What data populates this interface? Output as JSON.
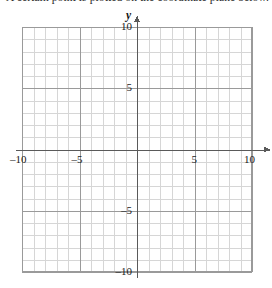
{
  "page": {
    "clipped_heading_text": "A certain point is plotted on the coordinate plane below.",
    "background_color": "#ffffff"
  },
  "figure": {
    "name": "coordinate-plane",
    "colors": {
      "minor_grid": "#d6d6d6",
      "major_grid": "#9a9a9a",
      "axis": "#5a5a5a",
      "label_text": "#1a1a1a"
    },
    "x_axis": {
      "letter": "y",
      "letter_x": "x",
      "min": -10,
      "max": 10,
      "tick_labels": [
        {
          "value": -10,
          "text": "–10"
        },
        {
          "value": -5,
          "text": "–5"
        },
        {
          "value": 5,
          "text": "5"
        },
        {
          "value": 10,
          "text": "10"
        }
      ]
    },
    "y_axis": {
      "min": -10,
      "max": 10,
      "tick_labels": [
        {
          "value": 10,
          "text": "10"
        },
        {
          "value": 5,
          "text": "5"
        },
        {
          "value": -5,
          "text": "–5"
        },
        {
          "value": -10,
          "text": "–10"
        }
      ]
    },
    "grid": {
      "minor_step": 1,
      "major_step": 5,
      "columns": 20,
      "rows": 20
    }
  },
  "chart_data": {
    "type": "scatter",
    "title": "",
    "xlabel": "x",
    "ylabel": "y",
    "xlim": [
      -10,
      10
    ],
    "ylim": [
      -10,
      10
    ],
    "xticks": [
      -10,
      -5,
      5,
      10
    ],
    "yticks": [
      10,
      5,
      -5,
      -10
    ],
    "grid": true,
    "minor_grid_step": 1,
    "major_grid_step": 5,
    "legend": null,
    "series": [],
    "points": [],
    "annotations": []
  }
}
